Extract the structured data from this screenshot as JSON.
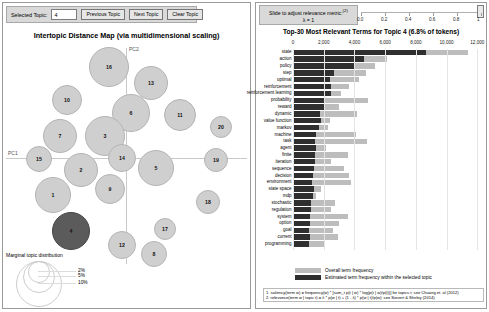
{
  "toolbar": {
    "selected_topic_label": "Selected Topic:",
    "selected_topic_value": "4",
    "previous_topic": "Previous Topic",
    "next_topic": "Next Topic",
    "clear_topic": "Clear Topic"
  },
  "map": {
    "title": "Intertopic Distance Map (via multidimensional scaling)",
    "axis_x_label": "PC1",
    "axis_y_label": "PC2",
    "legend_title": "Marginal topic distribution",
    "legend_sizes": [
      "2%",
      "5%",
      "10%"
    ],
    "selected_topic": 4,
    "topics": [
      {
        "id": 16,
        "cx": 105,
        "cy": 25,
        "r": 20
      },
      {
        "id": 13,
        "cx": 147,
        "cy": 41,
        "r": 17
      },
      {
        "id": 10,
        "cx": 63,
        "cy": 58,
        "r": 15
      },
      {
        "id": 6,
        "cx": 127,
        "cy": 71,
        "r": 19
      },
      {
        "id": 11,
        "cx": 176,
        "cy": 73,
        "r": 16
      },
      {
        "id": 7,
        "cx": 56,
        "cy": 94,
        "r": 17
      },
      {
        "id": 3,
        "cx": 101,
        "cy": 94,
        "r": 20
      },
      {
        "id": 20,
        "cx": 217,
        "cy": 85,
        "r": 11
      },
      {
        "id": 15,
        "cx": 35,
        "cy": 117,
        "r": 13
      },
      {
        "id": 14,
        "cx": 118,
        "cy": 116,
        "r": 14
      },
      {
        "id": 19,
        "cx": 212,
        "cy": 118,
        "r": 12
      },
      {
        "id": 2,
        "cx": 77,
        "cy": 128,
        "r": 17
      },
      {
        "id": 5,
        "cx": 152,
        "cy": 126,
        "r": 18
      },
      {
        "id": 9,
        "cx": 106,
        "cy": 147,
        "r": 15
      },
      {
        "id": 1,
        "cx": 49,
        "cy": 153,
        "r": 18
      },
      {
        "id": 18,
        "cx": 204,
        "cy": 160,
        "r": 12
      },
      {
        "id": 4,
        "cx": 67,
        "cy": 189,
        "r": 19
      },
      {
        "id": 17,
        "cx": 161,
        "cy": 187,
        "r": 11
      },
      {
        "id": 12,
        "cx": 118,
        "cy": 203,
        "r": 14
      },
      {
        "id": 8,
        "cx": 150,
        "cy": 212,
        "r": 13
      }
    ]
  },
  "relevance": {
    "slider_label": "Slide to adjust relevance metric:",
    "slider_superscript": "(2)",
    "lambda_label": "λ = 1",
    "lambda_value": 1,
    "ticks": [
      "0.0",
      "0.2",
      "0.4",
      "0.6",
      "0.8",
      "1"
    ]
  },
  "chart_data": {
    "type": "bar",
    "title": "Top-30 Most Relevant Terms for Topic 4 (6.8% of tokens)",
    "xlabel": "",
    "ylabel": "",
    "xlim": [
      0,
      12500
    ],
    "grid": true,
    "orientation": "horizontal",
    "tick_labels": [
      "0",
      "2,000",
      "4,000",
      "6,000",
      "8,000",
      "10,000",
      "12,000"
    ],
    "tick_values": [
      0,
      2000,
      4000,
      6000,
      8000,
      10000,
      12000
    ],
    "legend_position": "bottom",
    "categories": [
      "state",
      "action",
      "policy",
      "step",
      "optimal",
      "reinforcement",
      "reinforcement learning",
      "probability",
      "reward",
      "dynamic",
      "value function",
      "markov",
      "machine",
      "task",
      "agent",
      "finite",
      "iteration",
      "sequence",
      "decision",
      "environment",
      "state space",
      "mdp",
      "stochastic",
      "regulation",
      "system",
      "option",
      "goal",
      "current",
      "programming"
    ],
    "series": [
      {
        "name": "Overall term frequency",
        "color": "#bdbdbd",
        "values": [
          11400,
          6100,
          5350,
          4750,
          4300,
          3650,
          3100,
          4900,
          3000,
          4150,
          2400,
          2300,
          4100,
          4800,
          2150,
          3600,
          2500,
          3350,
          3650,
          3800,
          1800,
          1500,
          2750,
          2500,
          3600,
          3000,
          2600,
          2900,
          2000
        ]
      },
      {
        "name": "Estimated term frequency within the selected topic",
        "color": "#2f2f2f",
        "values": [
          8650,
          4600,
          4000,
          2650,
          2400,
          2500,
          2450,
          2100,
          2050,
          1750,
          1800,
          1700,
          1500,
          1450,
          1500,
          1400,
          1450,
          1350,
          1300,
          1250,
          1350,
          1300,
          1150,
          1150,
          1100,
          1100,
          1050,
          1100,
          1050
        ]
      }
    ]
  },
  "footnotes": [
    "1. saliency(term w) = frequency(w) * [sum_t p(t | w) * log(p(t | w)/p(t))] for topics t; see Chuang et. al (2012)",
    "2. relevance(term w | topic t) = λ * p(w | t) + (1 - λ) * p(w | t)/p(w); see Sievert & Shirley (2014)"
  ]
}
